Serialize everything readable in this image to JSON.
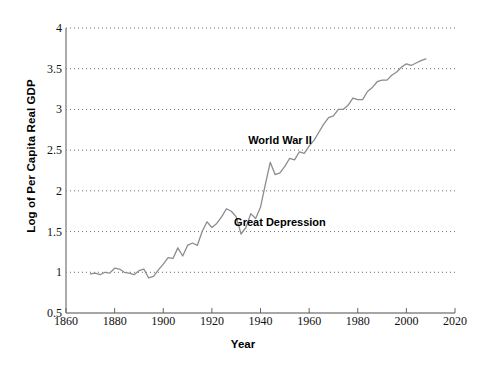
{
  "chart_data": {
    "type": "line",
    "title": "",
    "xlabel": "Year",
    "ylabel": "Log of Per Capita Real GDP",
    "xlim": [
      1860,
      2020
    ],
    "ylim": [
      0.5,
      4
    ],
    "xticks": [
      1860,
      1880,
      1900,
      1920,
      1940,
      1960,
      1980,
      2000,
      2020
    ],
    "yticks": [
      0.5,
      1,
      1.5,
      2,
      2.5,
      3,
      3.5,
      4
    ],
    "grid": "horizontal-dotted",
    "legend": "none",
    "line_color": "#8c8c8c",
    "series": [
      {
        "name": "Log of Per Capita Real GDP",
        "x": [
          1870,
          1872,
          1874,
          1876,
          1878,
          1880,
          1882,
          1884,
          1886,
          1888,
          1890,
          1892,
          1894,
          1896,
          1898,
          1900,
          1902,
          1904,
          1906,
          1908,
          1910,
          1912,
          1914,
          1916,
          1918,
          1920,
          1922,
          1924,
          1926,
          1928,
          1930,
          1932,
          1934,
          1936,
          1938,
          1940,
          1942,
          1944,
          1946,
          1948,
          1950,
          1952,
          1954,
          1956,
          1958,
          1960,
          1962,
          1964,
          1966,
          1968,
          1970,
          1972,
          1974,
          1976,
          1978,
          1980,
          1982,
          1984,
          1986,
          1988,
          1990,
          1992,
          1994,
          1996,
          1998,
          2000,
          2002,
          2004,
          2006,
          2008
        ],
        "y": [
          0.98,
          0.99,
          0.97,
          1.0,
          0.99,
          1.05,
          1.04,
          1.0,
          0.99,
          0.97,
          1.02,
          1.04,
          0.93,
          0.95,
          1.03,
          1.1,
          1.18,
          1.17,
          1.3,
          1.2,
          1.33,
          1.36,
          1.33,
          1.5,
          1.62,
          1.55,
          1.6,
          1.68,
          1.78,
          1.75,
          1.68,
          1.47,
          1.55,
          1.72,
          1.66,
          1.8,
          2.08,
          2.35,
          2.2,
          2.22,
          2.3,
          2.4,
          2.38,
          2.48,
          2.46,
          2.55,
          2.62,
          2.72,
          2.82,
          2.9,
          2.92,
          3.0,
          3.0,
          3.05,
          3.14,
          3.12,
          3.12,
          3.22,
          3.27,
          3.34,
          3.36,
          3.36,
          3.42,
          3.46,
          3.52,
          3.56,
          3.54,
          3.57,
          3.6,
          3.62
        ]
      }
    ],
    "annotations": [
      {
        "text": "World War II",
        "x": 1948,
        "y": 2.62
      },
      {
        "text": "Great Depression",
        "x": 1948,
        "y": 1.62
      }
    ]
  },
  "axes": {
    "x_tick_labels": [
      "1860",
      "1880",
      "1900",
      "1920",
      "1940",
      "1960",
      "1980",
      "2000",
      "2020"
    ],
    "y_tick_labels": [
      "0.5",
      "1",
      "1.5",
      "2",
      "2.5",
      "3",
      "3.5",
      "4"
    ],
    "x_title": "Year",
    "y_title": "Log of Per Capita Real GDP"
  },
  "annotation_labels": {
    "wwii": "World War II",
    "depression": "Great Depression"
  }
}
